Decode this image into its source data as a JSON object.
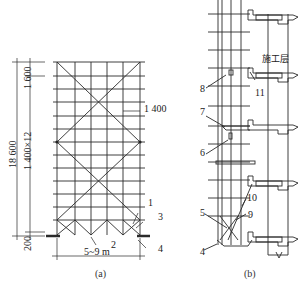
{
  "figure_a": {
    "caption": "(a)",
    "dimensions": {
      "total_height": "18 600",
      "top_lift": "1 600",
      "lifts": "1 400×12",
      "base": "200",
      "bay_spacing": "1 400",
      "width": "5~9 m"
    },
    "callouts": [
      "1",
      "2",
      "3",
      "4"
    ]
  },
  "figure_b": {
    "caption": "(b)",
    "working_floor_label": "施工层",
    "callouts": [
      "4",
      "5",
      "6",
      "7",
      "8",
      "9",
      "10",
      "11"
    ]
  },
  "colors": {
    "line": "#222222",
    "background": "#ffffff"
  }
}
